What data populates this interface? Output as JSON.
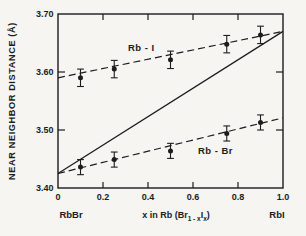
{
  "figure": {
    "background": "#f6f5f1"
  },
  "chart_data": {
    "type": "scatter",
    "title": "",
    "ylabel": "NEAR NEIGHBOR DISTANCE (Å)",
    "xlabel_parts": [
      {
        "t": "x in Rb (Br",
        "sub": false
      },
      {
        "t": "1 - x",
        "sub": true
      },
      {
        "t": "I",
        "sub": false
      },
      {
        "t": "x",
        "sub": true
      },
      {
        "t": ")",
        "sub": false
      }
    ],
    "xlim": [
      0,
      1.0
    ],
    "ylim": [
      3.4,
      3.7
    ],
    "x_ticks": [
      0,
      0.2,
      0.4,
      0.6,
      0.8,
      1.0
    ],
    "x_tick_labels": [
      "0",
      "0.2",
      "0.4",
      "0.6",
      "0.8",
      "1.0"
    ],
    "y_ticks": [
      3.4,
      3.5,
      3.6,
      3.7
    ],
    "y_tick_labels": [
      "3.40",
      "3.50",
      "3.60",
      "3.70"
    ],
    "x_end_labels": {
      "left": "RbBr",
      "right": "RbI"
    },
    "series": [
      {
        "name": "Rb - I",
        "x": [
          0.1,
          0.25,
          0.5,
          0.75,
          0.9
        ],
        "y": [
          3.59,
          3.605,
          3.621,
          3.648,
          3.664
        ],
        "yerr": 0.015,
        "marker": "filled-circle",
        "trend_line": {
          "x0": 0,
          "y0": 3.59,
          "x1": 1.0,
          "y1": 3.67,
          "style": "dashed"
        },
        "label_pos": {
          "x": 0.37,
          "y": 3.636
        }
      },
      {
        "name": "Rb - Br",
        "x": [
          0.1,
          0.25,
          0.5,
          0.75,
          0.9
        ],
        "y": [
          3.436,
          3.449,
          3.464,
          3.494,
          3.513
        ],
        "yerr": 0.013,
        "marker": "filled-circle",
        "trend_line": {
          "x0": 0,
          "y0": 3.425,
          "x1": 1.0,
          "y1": 3.521,
          "style": "dashed"
        },
        "label_pos": {
          "x": 0.7,
          "y": 3.459
        }
      }
    ],
    "reference_line": {
      "x0": 0,
      "y0": 3.425,
      "x1": 1.0,
      "y1": 3.67,
      "style": "solid"
    },
    "grid": false,
    "legend": "inline-labels",
    "colors": {
      "ink": "#1c1c1c",
      "background": "#f6f5f1"
    }
  }
}
